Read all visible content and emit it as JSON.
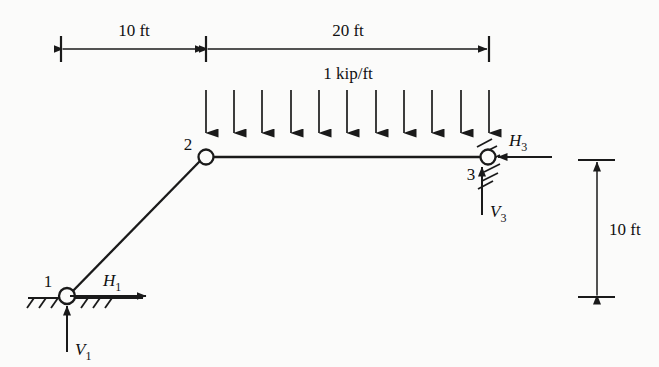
{
  "figure": {
    "line_color": "#1a1a1a",
    "background": "#fbfbfa"
  },
  "dimensions": {
    "top_left_span": "10 ft",
    "top_right_span": "20 ft",
    "right_height": "10 ft"
  },
  "load": {
    "label": "1 kip/ft",
    "arrow_count": 11,
    "direction": "down"
  },
  "joints": [
    {
      "id": "1",
      "label": "1",
      "type": "pin-support-horizontal-ground"
    },
    {
      "id": "2",
      "label": "2",
      "type": "hinge"
    },
    {
      "id": "3",
      "label": "3",
      "type": "pin-support-inclined-hatch"
    }
  ],
  "reactions": [
    {
      "name": "H1",
      "label": "H",
      "subscript": "1",
      "direction": "right"
    },
    {
      "name": "V1",
      "label": "V",
      "subscript": "1",
      "direction": "up"
    },
    {
      "name": "H3",
      "label": "H",
      "subscript": "3",
      "direction": "left"
    },
    {
      "name": "V3",
      "label": "V",
      "subscript": "3",
      "direction": "up"
    }
  ]
}
